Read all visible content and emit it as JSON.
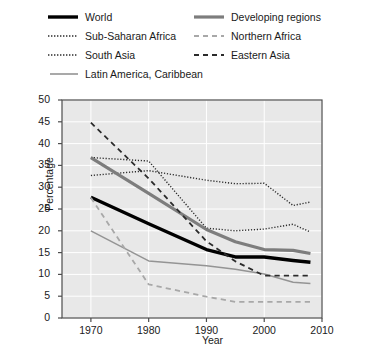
{
  "chart_data": {
    "type": "line",
    "title": "",
    "xlabel": "Year",
    "ylabel": "Percentage",
    "xlim": [
      1965,
      2010
    ],
    "ylim": [
      0,
      50
    ],
    "xticks": [
      1970,
      1980,
      1990,
      2000,
      2010
    ],
    "yticks": [
      0,
      5,
      10,
      15,
      20,
      25,
      30,
      35,
      40,
      45,
      50
    ],
    "grid": true,
    "legend_position": "above-plot",
    "x": [
      1970,
      1980,
      1990,
      1995,
      2000,
      2005,
      2008
    ],
    "series": [
      {
        "name": "World",
        "values": [
          27.7,
          21.6,
          15.7,
          14.0,
          14.0,
          13.2,
          12.8
        ],
        "color": "#000000",
        "style": "solid",
        "width": 3.4
      },
      {
        "name": "Sub-Saharan Africa",
        "values": [
          32.7,
          33.8,
          31.6,
          30.8,
          30.9,
          25.8,
          26.6
        ],
        "color": "#2b2b2b",
        "style": "dotted",
        "width": 1.4
      },
      {
        "name": "South Asia",
        "values": [
          36.8,
          36.0,
          20.6,
          20.0,
          20.4,
          21.5,
          19.7
        ],
        "color": "#2b2b2b",
        "style": "dotted",
        "width": 1.4
      },
      {
        "name": "Latin America, Caribbean",
        "values": [
          20.0,
          13.1,
          12.0,
          11.2,
          10.1,
          8.2,
          7.9
        ],
        "color": "#949494",
        "style": "solid",
        "width": 1.5
      },
      {
        "name": "Developing regions",
        "values": [
          36.8,
          28.6,
          20.3,
          17.5,
          15.7,
          15.5,
          14.8
        ],
        "color": "#7d7d7d",
        "style": "solid",
        "width": 3.2
      },
      {
        "name": "Northern Africa",
        "values": [
          27.6,
          7.7,
          4.9,
          3.7,
          3.7,
          3.7,
          3.7
        ],
        "color": "#a8a8a8",
        "style": "dashed",
        "width": 1.8
      },
      {
        "name": "Eastern Asia",
        "values": [
          44.8,
          32.0,
          17.6,
          13.0,
          9.7,
          9.7,
          9.7
        ],
        "color": "#2b2b2b",
        "style": "dashed",
        "width": 1.8
      }
    ]
  },
  "legend": {
    "entries": [
      {
        "label": "World",
        "column": 0,
        "row": 0
      },
      {
        "label": "Sub-Saharan Africa",
        "column": 0,
        "row": 1
      },
      {
        "label": "South Asia",
        "column": 0,
        "row": 2
      },
      {
        "label": "Latin America, Caribbean",
        "column": 0,
        "row": 3
      },
      {
        "label": "Developing regions",
        "column": 1,
        "row": 0
      },
      {
        "label": "Northern Africa",
        "column": 1,
        "row": 1
      },
      {
        "label": "Eastern Asia",
        "column": 1,
        "row": 2
      }
    ]
  },
  "axes": {
    "y_title": "Percentage",
    "x_title": "Year",
    "y_tick_labels": [
      "50",
      "45",
      "40",
      "35",
      "30",
      "25",
      "20",
      "15",
      "10",
      "5",
      "0"
    ],
    "x_tick_labels": [
      "1970",
      "1980",
      "1990",
      "2000",
      "2010"
    ]
  },
  "colors": {
    "plot_background": "#e8e8e8",
    "grid": "#ffffff",
    "frame": "#4d4d4d",
    "text": "#1a1a1a"
  }
}
